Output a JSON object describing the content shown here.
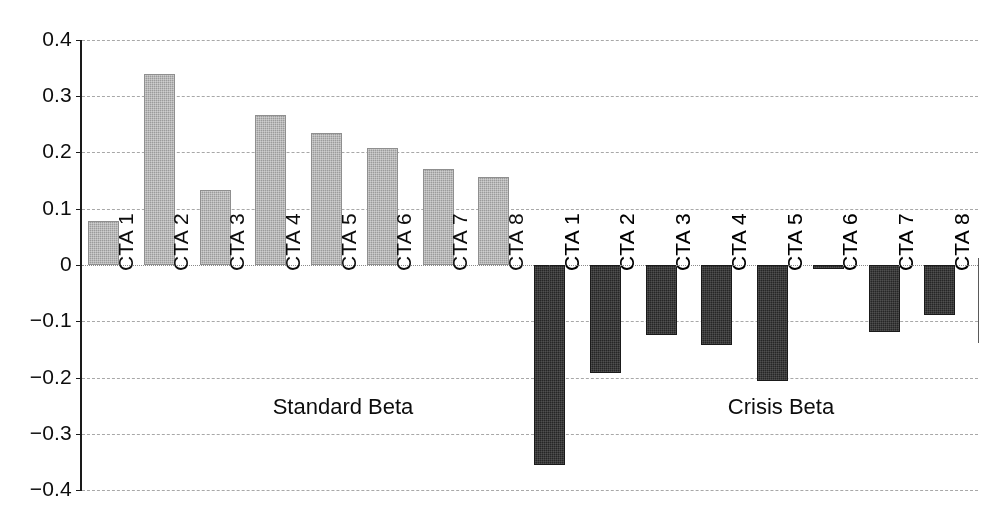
{
  "chart_data": {
    "type": "bar",
    "title": "",
    "xlabel": "",
    "ylabel": "",
    "ylim": [
      -0.4,
      0.4
    ],
    "grid": true,
    "legend": "none",
    "y_ticks": [
      "0.4",
      "0.3",
      "0.2",
      "0.1",
      "0",
      "-0.1",
      "-0.2",
      "-0.3",
      "-0.4"
    ],
    "y_tick_values": [
      0.4,
      0.3,
      0.2,
      0.1,
      0,
      -0.1,
      -0.2,
      -0.3,
      -0.4
    ],
    "categories": [
      "CTA 1",
      "CTA 2",
      "CTA 3",
      "CTA 4",
      "CTA 5",
      "CTA 6",
      "CTA 7",
      "CTA 8",
      "CTA 1",
      "CTA 2",
      "CTA 3",
      "CTA 4",
      "CTA 5",
      "CTA 6",
      "CTA 7",
      "CTA 8"
    ],
    "values": [
      0.078,
      0.339,
      0.133,
      0.266,
      0.234,
      0.208,
      0.17,
      0.156,
      -0.355,
      -0.191,
      -0.124,
      -0.142,
      -0.206,
      -0.007,
      -0.119,
      -0.088
    ],
    "groups": [
      {
        "name": "Standard Beta",
        "categories": [
          "CTA 1",
          "CTA 2",
          "CTA 3",
          "CTA 4",
          "CTA 5",
          "CTA 6",
          "CTA 7",
          "CTA 8"
        ],
        "values": [
          0.078,
          0.339,
          0.133,
          0.266,
          0.234,
          0.208,
          0.17,
          0.156
        ]
      },
      {
        "name": "Crisis Beta",
        "categories": [
          "CTA 1",
          "CTA 2",
          "CTA 3",
          "CTA 4",
          "CTA 5",
          "CTA 6",
          "CTA 7",
          "CTA 8"
        ],
        "values": [
          -0.355,
          -0.191,
          -0.124,
          -0.142,
          -0.206,
          -0.007,
          -0.119,
          -0.088
        ]
      }
    ],
    "colors": {
      "standard_beta_bar": "#9b9b9b",
      "crisis_beta_bar": "#262626",
      "axis": "#1a1a1a",
      "gridline": "#9a9a9a",
      "background": "#ffffff"
    },
    "annotations": [
      {
        "text": "Standard Beta",
        "x_center": 343,
        "y": 408
      },
      {
        "text": "Crisis Beta",
        "x_center": 781,
        "y": 408
      }
    ]
  }
}
